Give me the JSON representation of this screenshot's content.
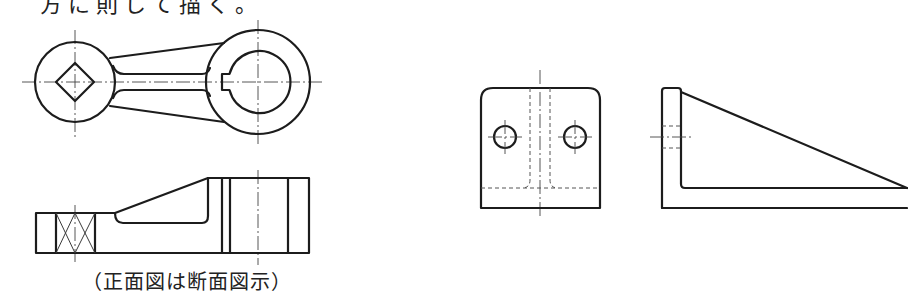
{
  "heading_partial": "方に則して描く。",
  "figures": [
    {
      "id": "lever",
      "views": [
        "top-view",
        "front-view-section"
      ],
      "caption": "（正面図は断面図示）"
    },
    {
      "id": "bracket",
      "views": [
        "front-view",
        "side-view"
      ]
    }
  ],
  "colors": {
    "line": "#1c1c1c",
    "background": "#ffffff"
  }
}
